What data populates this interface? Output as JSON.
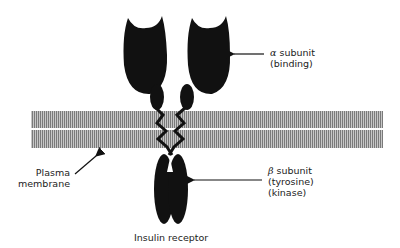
{
  "title": "Insulin receptor",
  "labels": {
    "alpha": {
      "symbol": "α",
      "line1": "subunit",
      "line2": "(binding)"
    },
    "beta": {
      "symbol": "β",
      "line1": "subunit",
      "line2": "(tyrosine)",
      "line3": "(kinase)"
    },
    "membrane": {
      "line1": "Plasma",
      "line2": "membrane"
    }
  },
  "colors": {
    "protein": "#111111",
    "membrane": "#8a8a8a",
    "membrane_stripe": "#c8c8c8",
    "text": "#222222"
  }
}
